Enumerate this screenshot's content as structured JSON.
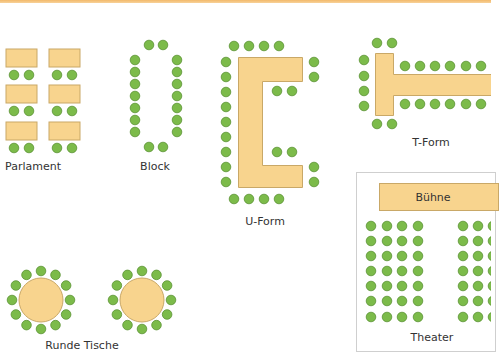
{
  "colors": {
    "accent_bar": "#f3b96a",
    "table_fill": "#f8d48e",
    "table_border": "#c9a867",
    "chair_fill": "#7cbb4a",
    "chair_border": "#5a9234",
    "box_border": "#cfcfcf"
  },
  "layouts": [
    {
      "id": "parlament",
      "label": "Parlament"
    },
    {
      "id": "block",
      "label": "Block"
    },
    {
      "id": "u-form",
      "label": "U-Form"
    },
    {
      "id": "t-form",
      "label": "T-Form"
    },
    {
      "id": "runde-tische",
      "label": "Runde Tische"
    },
    {
      "id": "theater",
      "label": "Theater",
      "stage_label": "Bühne",
      "rows": 7,
      "left_block_cols": 4
    }
  ]
}
